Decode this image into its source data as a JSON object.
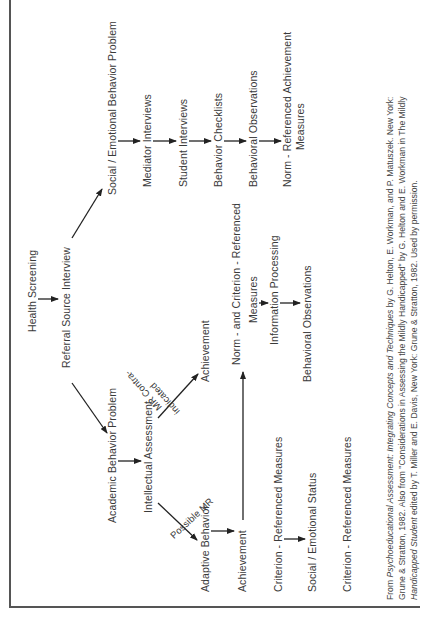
{
  "diagram": {
    "root": {
      "health_screening": "Health Screening",
      "referral_source_interview": "Referral Source Interview"
    },
    "social_emotional_branch": {
      "title": "Social / Emotional Behavior Problem",
      "steps": [
        "Mediator Interviews",
        "Student Interviews",
        "Behavior Checklists",
        "Behavioral Observations"
      ],
      "final_line1": "Norm - Referenced Achievement",
      "final_line2": "Measures"
    },
    "academic_branch": {
      "title": "Academic Behavior Problem",
      "intellectual_assessment": "Intellectual Assessment",
      "possible_mr_label": "Possible MR",
      "mr_contraindicated_line1": "MR Contra-",
      "mr_contraindicated_line2": "indicated",
      "possible_mr_path": [
        "Adaptive Behavior",
        "Achievement",
        "Criterion - Referenced Measures",
        "Social / Emotional Status",
        "Criterion - Referenced Measures"
      ],
      "contraindicated_path": {
        "achievement": "Achievement",
        "norm_criterion_line1": "Norm - and Criterion - Referenced",
        "norm_criterion_line2": "Measures",
        "information_processing": "Information Processing",
        "behavioral_observations": "Behavioral Observations"
      }
    }
  },
  "citation": {
    "line1_prefix": "From ",
    "line1_title": "Psychoeducational Assessment: Integrating Concepts and Techniques",
    "line1_suffix": " by G. Helton, E. Workman, and P. Matuszek. New York:",
    "line2": "Grune & Stratton, 1982. Also from \"Considerations in Assessing the Mildly Handicapped\" by G. Helton and E. Workman in The Mildly",
    "line3_title": "Handicapped Student",
    "line3_suffix": " edited by T. Miller and E. Davis, New York: Grune & Stratton, 1982. Used by permission."
  }
}
